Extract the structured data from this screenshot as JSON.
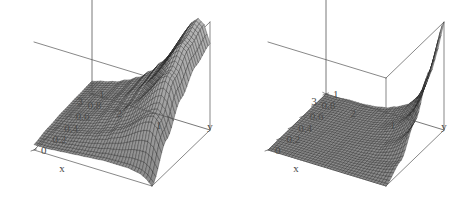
{
  "figure": {
    "background_color": "#ffffff",
    "panel_count": 2,
    "layout": "side-by-side"
  },
  "chart_data": [
    {
      "type": "surface3d",
      "panel": "left",
      "title": "",
      "xlabel": "x",
      "ylabel": "y",
      "zlabel": "",
      "xlim": [
        0,
        3
      ],
      "ylim": [
        0,
        1
      ],
      "xticks": [
        "1",
        "2",
        "3"
      ],
      "xtick_values": [
        1,
        2,
        3
      ],
      "yticks": [
        "0",
        "0.2",
        "0.4",
        "0.6",
        "0.8",
        "1"
      ],
      "ytick_values": [
        0,
        0.2,
        0.4,
        0.6,
        0.8,
        1
      ],
      "grid": true,
      "legend": "none",
      "mesh": {
        "style": "wireframe-shaded",
        "nx": 40,
        "ny": 30,
        "line_color": "#1a1a1a",
        "face_color": "#9a9a9a",
        "box_color": "#555555"
      },
      "description": "Surface rising to a broad ridge along small x, decaying smoothly toward large x; moderate peak height, surface overlaps the back-left box wall.",
      "peak_location": {
        "x": 0.35,
        "y": 1.0
      },
      "surface_z": {
        "z_max": 1.0,
        "z_min": 0.0,
        "form": "ridge along y at small x, monotone decay in x"
      },
      "z_grid_x": [
        0.0,
        0.15,
        0.3,
        0.45,
        0.6,
        0.75,
        0.9,
        1.05,
        1.2,
        1.5,
        1.8,
        2.1,
        2.4,
        2.7,
        3.0
      ],
      "z_grid_y": [
        0.0,
        0.25,
        0.5,
        0.75,
        1.0
      ],
      "z_values": [
        [
          0.0,
          0.3,
          0.55,
          0.72,
          0.8
        ],
        [
          0.05,
          0.45,
          0.72,
          0.88,
          0.96
        ],
        [
          0.08,
          0.5,
          0.76,
          0.92,
          1.0
        ],
        [
          0.09,
          0.48,
          0.72,
          0.87,
          0.95
        ],
        [
          0.1,
          0.44,
          0.65,
          0.78,
          0.86
        ],
        [
          0.1,
          0.39,
          0.57,
          0.69,
          0.76
        ],
        [
          0.1,
          0.34,
          0.5,
          0.6,
          0.66
        ],
        [
          0.1,
          0.3,
          0.43,
          0.52,
          0.57
        ],
        [
          0.1,
          0.27,
          0.38,
          0.45,
          0.5
        ],
        [
          0.09,
          0.21,
          0.29,
          0.35,
          0.38
        ],
        [
          0.08,
          0.17,
          0.23,
          0.27,
          0.29
        ],
        [
          0.07,
          0.14,
          0.18,
          0.21,
          0.23
        ],
        [
          0.06,
          0.11,
          0.15,
          0.17,
          0.18
        ],
        [
          0.05,
          0.09,
          0.12,
          0.14,
          0.15
        ],
        [
          0.05,
          0.08,
          0.1,
          0.11,
          0.12
        ]
      ]
    },
    {
      "type": "surface3d",
      "panel": "right",
      "title": "",
      "xlabel": "x",
      "ylabel": "y",
      "zlabel": "",
      "xlim": [
        0,
        3
      ],
      "ylim": [
        0,
        1
      ],
      "xticks": [
        "1",
        "2",
        "3"
      ],
      "xtick_values": [
        1,
        2,
        3
      ],
      "yticks": [
        "0",
        "0.2",
        "0.4",
        "0.6",
        "0.8",
        "1"
      ],
      "ytick_values": [
        0,
        0.2,
        0.4,
        0.6,
        0.8,
        1
      ],
      "grid": true,
      "legend": "none",
      "mesh": {
        "style": "wireframe-shaded",
        "nx": 40,
        "ny": 30,
        "line_color": "#1a1a1a",
        "face_color": "#8e8e8e",
        "box_color": "#555555"
      },
      "description": "Surface with a single sharp spike at the back-left corner (small x, large y) that falls off rapidly to a nearly flat low plateau over most of the domain.",
      "peak_location": {
        "x": 0.0,
        "y": 1.0
      },
      "surface_z": {
        "z_max": 1.0,
        "z_min": 0.0,
        "form": "sharp corner spike, rapid decay, flat elsewhere"
      },
      "z_grid_x": [
        0.0,
        0.15,
        0.3,
        0.45,
        0.6,
        0.75,
        0.9,
        1.05,
        1.2,
        1.5,
        1.8,
        2.1,
        2.4,
        2.7,
        3.0
      ],
      "z_grid_y": [
        0.0,
        0.25,
        0.5,
        0.75,
        1.0
      ],
      "z_values": [
        [
          0.0,
          0.1,
          0.34,
          0.68,
          1.0
        ],
        [
          0.0,
          0.07,
          0.24,
          0.5,
          0.74
        ],
        [
          0.0,
          0.05,
          0.17,
          0.35,
          0.53
        ],
        [
          0.0,
          0.04,
          0.12,
          0.25,
          0.38
        ],
        [
          0.0,
          0.03,
          0.09,
          0.18,
          0.27
        ],
        [
          0.0,
          0.02,
          0.06,
          0.13,
          0.2
        ],
        [
          0.0,
          0.02,
          0.05,
          0.1,
          0.14
        ],
        [
          0.0,
          0.01,
          0.04,
          0.07,
          0.11
        ],
        [
          0.0,
          0.01,
          0.03,
          0.05,
          0.08
        ],
        [
          0.0,
          0.01,
          0.02,
          0.03,
          0.04
        ],
        [
          0.0,
          0.0,
          0.01,
          0.02,
          0.02
        ],
        [
          0.0,
          0.0,
          0.01,
          0.01,
          0.01
        ],
        [
          0.0,
          0.0,
          0.0,
          0.01,
          0.01
        ],
        [
          0.0,
          0.0,
          0.0,
          0.0,
          0.0
        ],
        [
          0.0,
          0.0,
          0.0,
          0.0,
          0.0
        ]
      ]
    }
  ]
}
